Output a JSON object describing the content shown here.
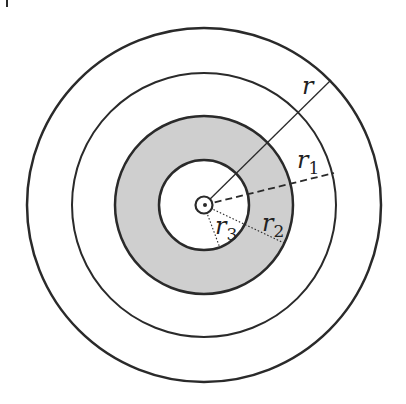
{
  "diagram": {
    "type": "concentric-circles",
    "center": [
      204,
      205
    ],
    "circles": [
      {
        "name": "outer",
        "r": 177
      },
      {
        "name": "second",
        "r": 132
      },
      {
        "name": "shaded-ring-outer",
        "r": 89
      },
      {
        "name": "inner-white",
        "r": 45
      },
      {
        "name": "core",
        "r": 9
      }
    ],
    "shading_color": "#cfcfcf",
    "stroke_color": "#2a2a2a",
    "labels": {
      "r": {
        "base": "r",
        "sub": ""
      },
      "r1": {
        "base": "r",
        "sub": "1"
      },
      "r2": {
        "base": "r",
        "sub": "2"
      },
      "r3": {
        "base": "r",
        "sub": "3"
      }
    },
    "corner_mark": "|"
  }
}
